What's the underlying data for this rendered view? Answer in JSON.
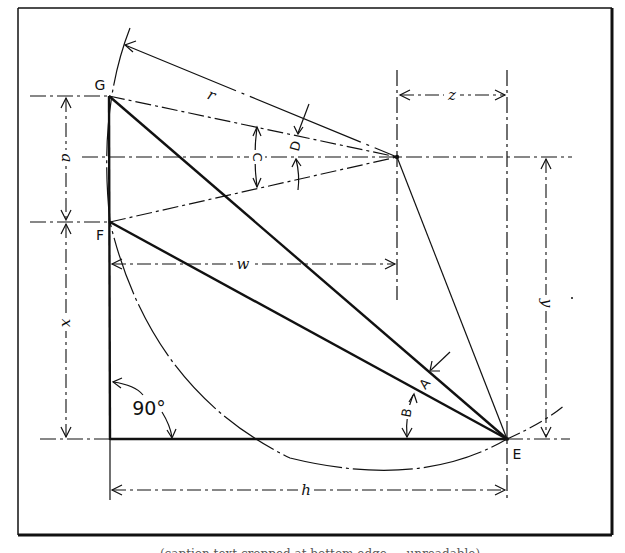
{
  "figure": {
    "frame": {
      "left": 18,
      "top": 8,
      "right": 613,
      "bottom": 535
    },
    "points": {
      "G": {
        "label": "G",
        "x": 109,
        "y": 96
      },
      "F": {
        "label": "F",
        "x": 110,
        "y": 222
      },
      "O": {
        "label": "",
        "x": 397,
        "y": 157
      },
      "E": {
        "label": "E",
        "x": 507,
        "y": 439
      }
    },
    "dimension_labels": {
      "r": "r",
      "z": "z",
      "a": "a",
      "w": "w",
      "x": "x",
      "y": "y",
      "h": "h"
    },
    "angle_labels": {
      "A": "A",
      "B": "B",
      "C": "C",
      "D": "D",
      "right_angle": "90°"
    },
    "caption_partial": "(caption text cropped at bottom edge — unreadable)"
  }
}
